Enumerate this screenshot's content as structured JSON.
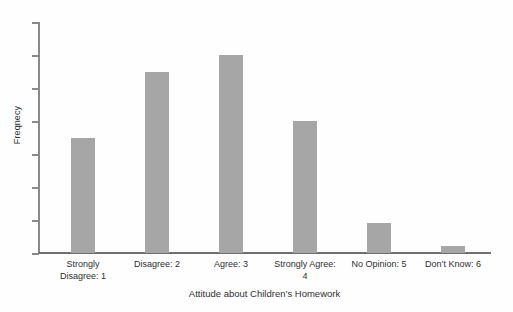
{
  "chart_data": {
    "type": "bar",
    "title": "",
    "xlabel": "Attitude about Children’s Homework",
    "ylabel": "Freqnecy",
    "categories": [
      "Strongly Disagree: 1",
      "Disagree: 2",
      "Agree: 3",
      "Strongly Agree: 4",
      "No Opinion: 5",
      "Don’t Know: 6"
    ],
    "category_lines": [
      [
        "Strongly",
        "Disagree: 1"
      ],
      [
        "Disagree: 2"
      ],
      [
        "Agree: 3"
      ],
      [
        "Strongly Agree:",
        "4"
      ],
      [
        "No Opinion: 5"
      ],
      [
        "Don’t Know: 6"
      ]
    ],
    "values": [
      3.5,
      5.5,
      6.0,
      4.0,
      0.9,
      0.2
    ],
    "ylim": [
      0,
      7
    ],
    "yticks": [
      0,
      1,
      2,
      3,
      4,
      5,
      6,
      7
    ],
    "ytick_labels": [
      "",
      "",
      "",
      "",
      "",
      "",
      "",
      ""
    ],
    "grid": false,
    "legend": false,
    "bar_color": "#a6a6a6",
    "axis_color": "#8a8a8a",
    "text_color": "#2f2f2f",
    "background": "#ffffff"
  },
  "layout": {
    "bar_width_px": 24,
    "bar_left_px": [
      71,
      145,
      219,
      293,
      367,
      441
    ],
    "baseline_y_px": 253,
    "axis_top_y_px": 22,
    "plot_left_px": 38,
    "plot_right_px": 491
  }
}
